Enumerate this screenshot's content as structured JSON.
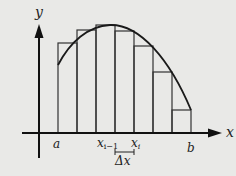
{
  "diagram": {
    "axes": {
      "x_label": "x",
      "y_label": "y"
    },
    "interval": {
      "left_label": "a",
      "right_label": "b"
    },
    "subinterval": {
      "left_label_base": "x",
      "left_label_sub": "i−1",
      "right_label_base": "x",
      "right_label_sub": "i",
      "width_label": "Δx"
    },
    "rectangles_count": 7,
    "colors": {
      "background": "#e9e9e7",
      "stroke": "#222222"
    }
  }
}
